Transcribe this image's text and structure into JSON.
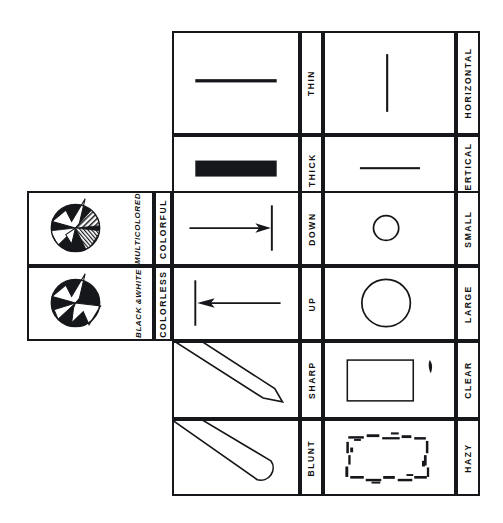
{
  "diagram": {
    "orientation": "rotated-90",
    "ink_color": "#15171a",
    "paper_color": "#ffffff",
    "panels": [
      {
        "name": "line-weight",
        "cells": [
          {
            "label": "THIN",
            "symbol": "thin-horizontal-bar"
          },
          {
            "label": "THICK",
            "symbol": "thick-horizontal-bar"
          }
        ]
      },
      {
        "name": "orientation",
        "cells": [
          {
            "label": "HORIZONTAL",
            "symbol": "vertical-stroke"
          },
          {
            "label": "VERTICAL",
            "symbol": "horizontal-stroke"
          }
        ]
      },
      {
        "name": "direction",
        "cells": [
          {
            "label": "DOWN",
            "symbol": "arrow-right-to-bar"
          },
          {
            "label": "UP",
            "symbol": "arrow-left-to-bar"
          }
        ]
      },
      {
        "name": "size",
        "cells": [
          {
            "label": "SMALL",
            "symbol": "small-circle"
          },
          {
            "label": "LARGE",
            "symbol": "large-circle"
          }
        ]
      },
      {
        "name": "point",
        "cells": [
          {
            "label": "SHARP",
            "symbol": "pointed-wedge"
          },
          {
            "label": "BLUNT",
            "symbol": "rounded-wedge"
          }
        ]
      },
      {
        "name": "focus",
        "cells": [
          {
            "label": "CLEAR",
            "symbol": "crisp-rectangle"
          },
          {
            "label": "HAZY",
            "symbol": "broken-outline-rectangle"
          }
        ]
      },
      {
        "name": "color",
        "cells": [
          {
            "label": "COLORFUL",
            "symbol": "hatched-star-disc",
            "caption": "MULTICOLORED"
          },
          {
            "label": "COLORLESS",
            "symbol": "solid-star-disc",
            "caption": "BLACK &WHITE"
          }
        ]
      }
    ]
  }
}
